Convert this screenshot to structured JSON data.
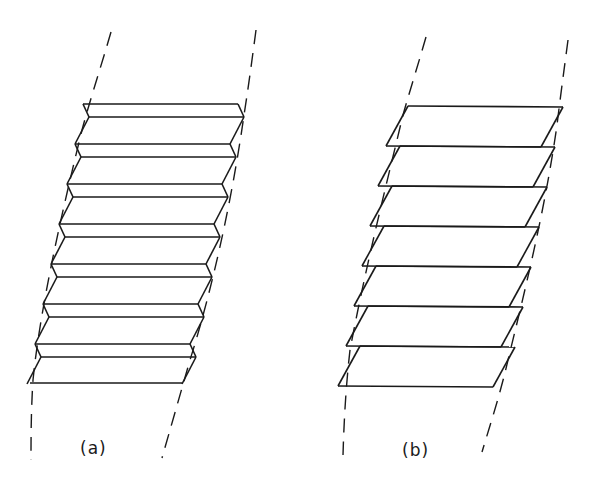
{
  "figure": {
    "panels": [
      {
        "id": "a",
        "label": "(a)",
        "description": "Stacked folded (chevron-edged) layers between dashed boundaries",
        "layer_count": 7,
        "label_pos": [
          78,
          438
        ]
      },
      {
        "id": "b",
        "label": "(b)",
        "description": "Stacked sheared parallelogram layers between dashed boundaries",
        "layer_count": 7,
        "label_pos": [
          400,
          440
        ]
      }
    ],
    "colors": {
      "ink": "#1a1a1a",
      "background": "#ffffff"
    }
  }
}
